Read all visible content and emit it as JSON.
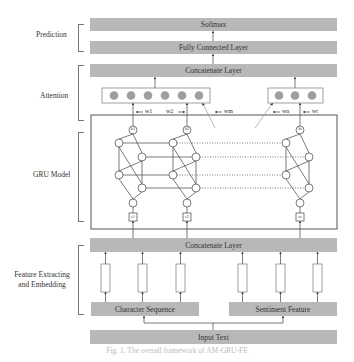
{
  "figure": {
    "sections": {
      "prediction": "Prediction",
      "attention": "Attention",
      "gru": "GRU Model",
      "feature": "Feature Extracting and Embedding",
      "feature_line1": "Feature Extracting",
      "feature_line2": "and Embedding"
    },
    "layers": {
      "softmax": "Softmax",
      "fully_connected": "Fully Connected Layer",
      "concat_top": "Concatenate Layer",
      "concat_bottom": "Concatenate Layer",
      "char_seq": "Character Sequence",
      "sentiment": "Sentiment Feature",
      "input": "Input Text"
    },
    "weights": [
      "w1",
      "w2",
      "wm",
      "wn",
      "wt"
    ],
    "hidden_nodes": [
      "h1",
      "h2",
      "ht"
    ],
    "inputs": [
      "e1",
      "e2",
      "et"
    ],
    "attention_groups": [
      {
        "node_count": 6
      },
      {
        "node_count": 3
      }
    ],
    "caption": "Fig. 1. The overall framework of AM-GRU-FE"
  },
  "colors": {
    "layer_fill": "#b8b8b8",
    "attention_node": "#9e9e9e",
    "line": "#555555"
  }
}
